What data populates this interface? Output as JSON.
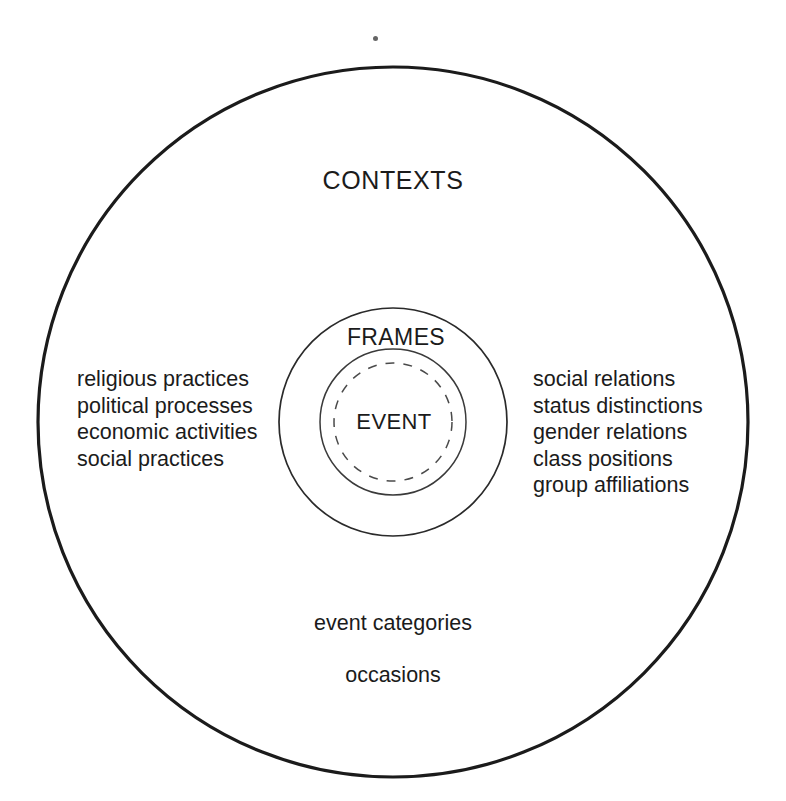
{
  "diagram": {
    "title_implicit": "Contexts, Frames and Event nested circles diagram",
    "background_color": "#ffffff",
    "stroke_color": "#1b1b1b",
    "rings": {
      "outer": {
        "label": "CONTEXTS",
        "cx": 393,
        "cy": 422,
        "r": 355,
        "stroke_width": 3.2,
        "dashed": false
      },
      "middle": {
        "label": "FRAMES",
        "cx": 393,
        "cy": 422,
        "r": 114,
        "stroke_width": 1.7,
        "dashed": false
      },
      "inner": {
        "label": "EVENT",
        "cx": 393,
        "cy": 422,
        "r": 73,
        "stroke_width": 1.5,
        "dashed": false
      },
      "inner_dashed": {
        "label": "",
        "cx": 393,
        "cy": 422,
        "r": 59,
        "stroke_width": 1.5,
        "dashed": true,
        "dash_pattern": "9 9"
      }
    },
    "left_items": [
      "religious practices",
      "political processes",
      "economic activities",
      "social practices"
    ],
    "right_items": [
      "social relations",
      "status distinctions",
      "gender relations",
      "class positions",
      "group affiliations"
    ],
    "bottom_items": [
      "event categories",
      "occasions"
    ]
  }
}
